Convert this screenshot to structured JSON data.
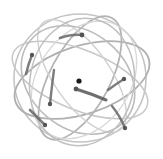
{
  "graphic": {
    "type": "orbit-sphere",
    "description": "Abstract sphere of overlapping elliptical orbits with comet particles and a central nucleus",
    "colors": {
      "background": "#ffffff",
      "orbit_dark": "#a8a8a8",
      "orbit_light": "#d6d6d6",
      "comet_head": "#555555",
      "nucleus": "#1a1a1a"
    },
    "orbit_count": 8,
    "comet_count": 6
  }
}
